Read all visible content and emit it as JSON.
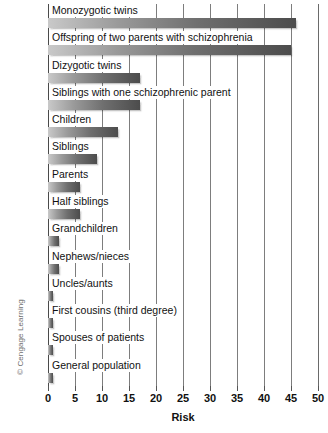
{
  "credit": "© Cengage Learning",
  "chart_data": {
    "type": "bar",
    "orientation": "horizontal",
    "title": "",
    "xlabel": "Risk",
    "ylabel": "",
    "xlim": [
      0,
      50
    ],
    "xticks": [
      0,
      5,
      10,
      15,
      20,
      25,
      30,
      35,
      40,
      45,
      50
    ],
    "grid": true,
    "legend": false,
    "categories": [
      "Monozygotic twins",
      "Offspring of two parents with schizophrenia",
      "Dizygotic twins",
      "Siblings with one schizophrenic parent",
      "Children",
      "Siblings",
      "Parents",
      "Half siblings",
      "Grandchildren",
      "Nephews/nieces",
      "Uncles/aunts",
      "First cousins (third degree)",
      "Spouses of patients",
      "General population"
    ],
    "values": [
      46,
      45,
      17,
      17,
      13,
      9,
      6,
      6,
      2,
      2,
      1,
      1,
      1,
      1
    ]
  }
}
